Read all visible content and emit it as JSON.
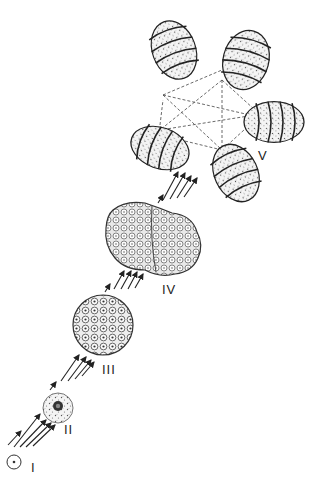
{
  "diagram": {
    "type": "developmental-stages",
    "stages": [
      {
        "id": "I",
        "label": "I",
        "shape": "single-cell"
      },
      {
        "id": "II",
        "label": "II",
        "shape": "cell-with-nucleus"
      },
      {
        "id": "III",
        "label": "III",
        "shape": "multicellular-sphere"
      },
      {
        "id": "IV",
        "label": "IV",
        "shape": "segmented-mass"
      },
      {
        "id": "V",
        "label": "V",
        "shape": "five-connected-segmented-bodies"
      }
    ],
    "arrows_between_stages": [
      {
        "from": "I",
        "to": "II",
        "count": 5
      },
      {
        "from": "II",
        "to": "III",
        "count": 5
      },
      {
        "from": "III",
        "to": "IV",
        "count": 5
      },
      {
        "from": "IV",
        "to": "V",
        "count": 5
      }
    ],
    "colors": {
      "ink": "#2a2a2a",
      "stipple": "#555555",
      "background": "#ffffff"
    }
  }
}
